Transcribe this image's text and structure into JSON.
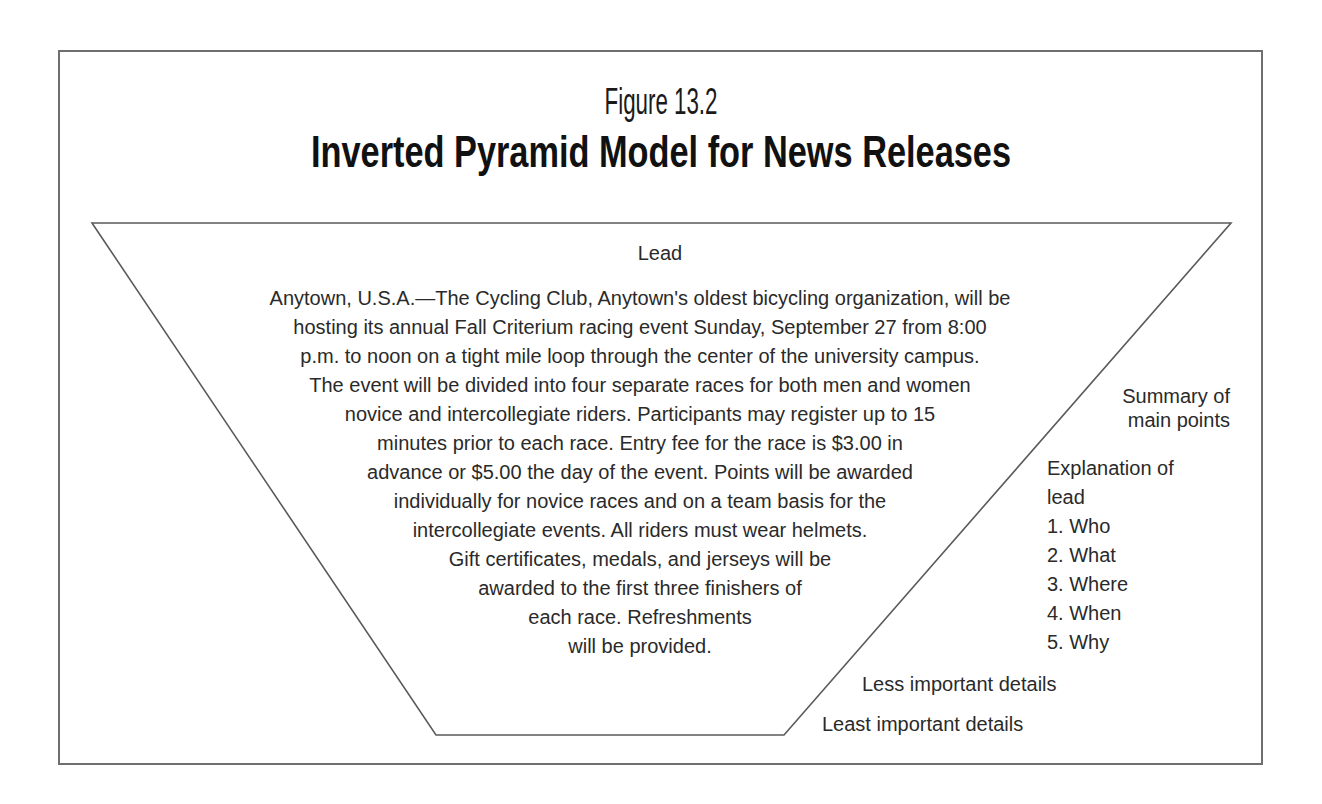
{
  "figure": {
    "number": "Figure 13.2",
    "title": "Inverted Pyramid Model for News Releases"
  },
  "pyramid": {
    "shape": "inverted-trapezoid",
    "vertices": {
      "top_left": [
        92,
        223
      ],
      "top_right": [
        1231,
        223
      ],
      "bottom_right": [
        784,
        735
      ],
      "bottom_left": [
        436,
        735
      ]
    },
    "line_color": "#5a5a5a",
    "lead_label": "Lead",
    "body_lines": [
      "Anytown, U.S.A.—The Cycling Club, Anytown's oldest bicycling organization, will be",
      "hosting its annual Fall Criterium racing event Sunday, September 27 from 8:00",
      "p.m. to noon on a tight mile loop through the center of the university campus.",
      "The event will be divided into four separate races for both men and women",
      "novice and intercollegiate riders. Participants may register up to 15",
      "minutes prior to each race. Entry fee for the race is $3.00 in",
      "advance or $5.00 the day of the event. Points will be awarded",
      "individually for novice races and on a team basis for the",
      "intercollegiate events. All riders must wear helmets.",
      "Gift certificates, medals, and jerseys will be",
      "awarded to the first three finishers of",
      "each race. Refreshments",
      "will be provided."
    ]
  },
  "annotations": {
    "summary": [
      "Summary of",
      "main points"
    ],
    "explanation": {
      "heading": [
        "Explanation of",
        "lead"
      ],
      "items": [
        "1. Who",
        "2. What",
        "3. Where",
        "4. When",
        "5. Why"
      ]
    },
    "less_important": "Less important details",
    "least_important": "Least important details"
  }
}
